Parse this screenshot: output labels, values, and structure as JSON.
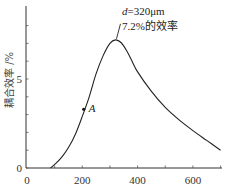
{
  "chart_data": {
    "type": "line",
    "title": "",
    "xlabel": "",
    "ylabel": "耦合效率 /%",
    "xlim": [
      0,
      700
    ],
    "ylim": [
      0,
      8.8
    ],
    "x_ticks": [
      0,
      200,
      400,
      600
    ],
    "x_tick_labels": [
      "0",
      "200",
      "400",
      "600"
    ],
    "y_ticks": [
      0,
      5
    ],
    "y_tick_labels": [
      "0",
      "5"
    ],
    "grid": false,
    "legend": null,
    "series": [
      {
        "name": "coupling efficiency",
        "x": [
          85,
          100,
          125,
          150,
          175,
          200,
          225,
          250,
          275,
          300,
          320,
          340,
          360,
          380,
          400,
          450,
          500,
          550,
          600,
          650,
          700
        ],
        "values": [
          0,
          0.2,
          0.6,
          1.15,
          1.9,
          2.9,
          4.0,
          5.3,
          6.3,
          7.0,
          7.2,
          7.05,
          6.6,
          6.0,
          5.4,
          4.3,
          3.4,
          2.7,
          2.1,
          1.55,
          1.0
        ]
      }
    ],
    "annotations": [
      {
        "text_italic": "d",
        "text": "=320μm",
        "line2": "7.2%的效率",
        "x": 320,
        "y": 7.2
      },
      {
        "text": "A",
        "x": 205,
        "y": 3.3,
        "marker": "dot"
      }
    ]
  }
}
